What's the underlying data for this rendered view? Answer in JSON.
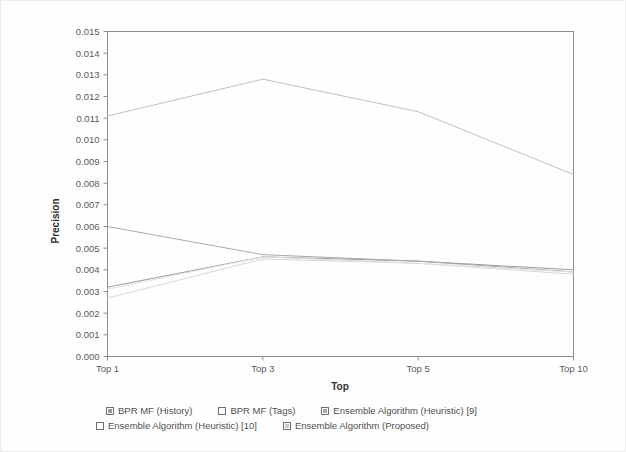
{
  "chart_data": {
    "type": "line",
    "title": "",
    "xlabel": "Top",
    "ylabel": "Precision",
    "categories": [
      "Top 1",
      "Top 3",
      "Top 5",
      "Top 10"
    ],
    "x": [
      1,
      3,
      5,
      10
    ],
    "ylim": [
      0.0,
      0.015
    ],
    "xlim": [
      1,
      10
    ],
    "grid": false,
    "legend_position": "bottom",
    "ytick_labels": [
      "0.000",
      "0.001",
      "0.002",
      "0.003",
      "0.004",
      "0.005",
      "0.006",
      "0.007",
      "0.008",
      "0.009",
      "0.010",
      "0.011",
      "0.012",
      "0.013",
      "0.014",
      "0.015"
    ],
    "ytick_values": [
      0.0,
      0.001,
      0.002,
      0.003,
      0.004,
      0.005,
      0.006,
      0.007,
      0.008,
      0.009,
      0.01,
      0.011,
      0.012,
      0.013,
      0.014,
      0.015
    ],
    "xtick_labels": [
      "Top 1",
      "Top 3",
      "Top 5",
      "Top 10"
    ],
    "series": [
      {
        "name": "BPR MF (History)",
        "color": "#9b9b9b",
        "values": [
          0.0032,
          0.0046,
          0.0044,
          0.004
        ]
      },
      {
        "name": "BPR MF (Tags)",
        "color": "#d6d6d6",
        "values": [
          0.0027,
          0.0045,
          0.0043,
          0.0038
        ]
      },
      {
        "name": "Ensemble Algorithm (Heuristic) [9]",
        "color": "#a8a8a8",
        "values": [
          0.006,
          0.0047,
          0.0044,
          0.0039
        ]
      },
      {
        "name": "Ensemble Algorithm (Heuristic) [10]",
        "color": "#e0e0e0",
        "values": [
          0.0031,
          0.0046,
          0.0043,
          0.0039
        ]
      },
      {
        "name": "Ensemble Algorithm (Proposed)",
        "color": "#c2c2c2",
        "values": [
          0.0111,
          0.0128,
          0.0113,
          0.0084
        ]
      }
    ]
  },
  "legend": {
    "rows": [
      [
        {
          "label": "BPR MF (History)",
          "color": "#9b9b9b"
        },
        {
          "label": "BPR MF (Tags)",
          "color": "#ffffff"
        },
        {
          "label": "Ensemble Algorithm (Heuristic) [9]",
          "color": "#a8a8a8"
        }
      ],
      [
        {
          "label": "Ensemble Algorithm (Heuristic) [10]",
          "color": "#ffffff"
        },
        {
          "label": "Ensemble Algorithm (Proposed)",
          "color": "#c8c8c8"
        }
      ]
    ]
  }
}
